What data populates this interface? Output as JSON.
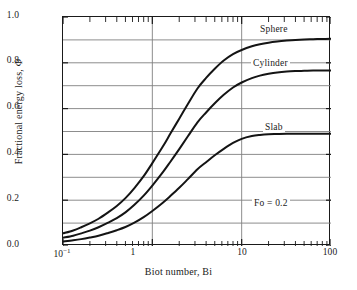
{
  "chart_data": {
    "type": "line",
    "title": "",
    "xlabel": "Biot number, Bi",
    "ylabel": "Fractional energy loss, Φ",
    "xscale": "log",
    "xlim": [
      0.1,
      100
    ],
    "ylim": [
      0.0,
      1.0
    ],
    "grid": true,
    "legend_position": "inline-right",
    "xticks": [
      {
        "value": 0.1,
        "label": "10",
        "exponent": "−1"
      },
      {
        "value": 1,
        "label": "1",
        "exponent": ""
      },
      {
        "value": 10,
        "label": "10",
        "exponent": ""
      },
      {
        "value": 100,
        "label": "100",
        "exponent": ""
      }
    ],
    "yticks": [
      {
        "value": 1.0,
        "label": "1.0"
      },
      {
        "value": 0.8,
        "label": "0.8"
      },
      {
        "value": 0.6,
        "label": "0.6"
      },
      {
        "value": 0.4,
        "label": "0.4"
      },
      {
        "value": 0.2,
        "label": "0.2"
      },
      {
        "value": 0.0,
        "label": "0.0"
      }
    ],
    "y_gridlines": [
      0.1,
      0.2,
      0.3,
      0.4,
      0.5,
      0.6,
      0.7,
      0.8,
      0.9
    ],
    "x_gridlines": [
      1,
      10
    ],
    "annotations": [
      {
        "text": "Fo = 0.2",
        "x": 18,
        "y": 0.21
      }
    ],
    "series": [
      {
        "name": "Sphere",
        "label": "Sphere",
        "color": "#141414",
        "label_x": 40,
        "label_y": 0.955,
        "x": [
          0.1,
          0.13,
          0.16,
          0.2,
          0.25,
          0.32,
          0.4,
          0.5,
          0.63,
          0.8,
          1.0,
          1.3,
          1.6,
          2.0,
          2.5,
          3.2,
          4.0,
          5.0,
          6.3,
          8.0,
          10.0,
          13.0,
          16.0,
          20.0,
          25.0,
          32.0,
          40.0,
          50.0,
          63.0,
          80.0,
          100.0
        ],
        "y": [
          0.055,
          0.068,
          0.082,
          0.099,
          0.119,
          0.147,
          0.175,
          0.209,
          0.253,
          0.305,
          0.362,
          0.432,
          0.492,
          0.556,
          0.62,
          0.688,
          0.734,
          0.774,
          0.81,
          0.838,
          0.856,
          0.872,
          0.881,
          0.888,
          0.893,
          0.897,
          0.9,
          0.902,
          0.903,
          0.904,
          0.905
        ]
      },
      {
        "name": "Cylinder",
        "label": "Cylinder",
        "color": "#141414",
        "label_x": 40,
        "label_y": 0.805,
        "x": [
          0.1,
          0.13,
          0.16,
          0.2,
          0.25,
          0.32,
          0.4,
          0.5,
          0.63,
          0.8,
          1.0,
          1.3,
          1.6,
          2.0,
          2.5,
          3.2,
          4.0,
          5.0,
          6.3,
          8.0,
          10.0,
          13.0,
          16.0,
          20.0,
          25.0,
          32.0,
          40.0,
          50.0,
          63.0,
          80.0,
          100.0
        ],
        "y": [
          0.036,
          0.045,
          0.055,
          0.067,
          0.082,
          0.102,
          0.122,
          0.147,
          0.18,
          0.22,
          0.264,
          0.32,
          0.369,
          0.423,
          0.479,
          0.54,
          0.583,
          0.623,
          0.66,
          0.692,
          0.714,
          0.733,
          0.744,
          0.752,
          0.758,
          0.762,
          0.764,
          0.765,
          0.766,
          0.766,
          0.766
        ]
      },
      {
        "name": "Slab",
        "label": "Slab",
        "color": "#141414",
        "label_x": 40,
        "label_y": 0.525,
        "x": [
          0.1,
          0.13,
          0.16,
          0.2,
          0.25,
          0.32,
          0.4,
          0.5,
          0.63,
          0.8,
          1.0,
          1.3,
          1.6,
          2.0,
          2.5,
          3.2,
          4.0,
          5.0,
          6.3,
          8.0,
          10.0,
          13.0,
          16.0,
          20.0,
          25.0,
          32.0,
          40.0,
          50.0,
          63.0,
          80.0,
          100.0
        ],
        "y": [
          0.02,
          0.025,
          0.03,
          0.037,
          0.045,
          0.057,
          0.069,
          0.083,
          0.102,
          0.126,
          0.153,
          0.188,
          0.219,
          0.254,
          0.292,
          0.335,
          0.366,
          0.396,
          0.424,
          0.45,
          0.468,
          0.48,
          0.485,
          0.488,
          0.489,
          0.49,
          0.49,
          0.49,
          0.49,
          0.49,
          0.49
        ]
      }
    ]
  }
}
